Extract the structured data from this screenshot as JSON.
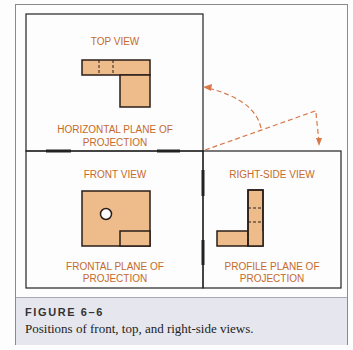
{
  "diagram": {
    "views": {
      "top": {
        "title": "TOP VIEW",
        "plane_line1": "HORIZONTAL PLANE OF",
        "plane_line2": "PROJECTION"
      },
      "front": {
        "title": "FRONT VIEW",
        "plane_line1": "FRONTAL PLANE OF",
        "plane_line2": "PROJECTION"
      },
      "right": {
        "title": "RIGHT-SIDE VIEW",
        "plane_line1": "PROFILE PLANE OF",
        "plane_line2": "PROJECTION"
      }
    },
    "colors": {
      "fill": "#eebb8a",
      "outline": "#2a1e18",
      "label": "#c46a2c",
      "arrow": "#d9784a",
      "frame": "#222222"
    }
  },
  "caption": {
    "label": "FIGURE 6–6",
    "text": "Positions of front, top, and right-side views."
  },
  "background_text": [
    "",
    "",
    "",
    ""
  ]
}
